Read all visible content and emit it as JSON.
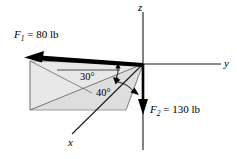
{
  "figure": {
    "axes": [
      {
        "name": "z-axis",
        "label": "z",
        "direction": "up"
      },
      {
        "name": "y-axis",
        "label": "y",
        "direction": "right"
      },
      {
        "name": "x-axis",
        "label": "x",
        "direction": "lower-left-front"
      }
    ],
    "forces": [
      {
        "name": "F1",
        "symbol": "F",
        "subscript": "1",
        "equals": "=",
        "magnitude": "80",
        "units": "lb",
        "label": "F1 = 80 lb",
        "direction": "up-left in xy plane region"
      },
      {
        "name": "F2",
        "symbol": "F",
        "subscript": "2",
        "equals": "=",
        "magnitude": "130",
        "units": "lb",
        "label": "F2 = 130 lb",
        "direction": "downward along negative z"
      }
    ],
    "angles": [
      {
        "name": "angle-30",
        "label": "30°",
        "value": "30",
        "unit": "deg"
      },
      {
        "name": "angle-40",
        "label": "40°",
        "value": "40",
        "unit": "deg"
      }
    ],
    "colors": {
      "line": "#000000",
      "axis": "#1a1a1a",
      "shaded_plane": "#dcdcdc",
      "thin_guide": "#6e6e6e",
      "background": "#ffffff"
    }
  }
}
